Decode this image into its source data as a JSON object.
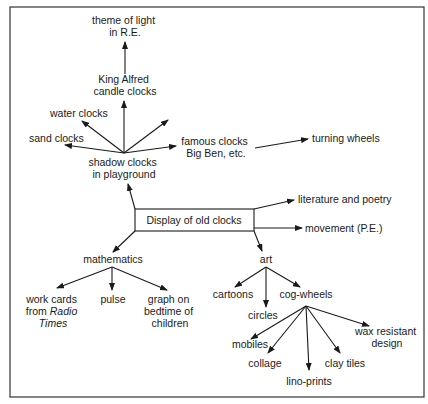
{
  "diagram": {
    "type": "mind-map",
    "center": "Display of old clocks",
    "nodes": {
      "theme_light": [
        "theme of light",
        "in R.E."
      ],
      "king_alfred": [
        "King Alfred",
        "candle clocks"
      ],
      "water_clocks": [
        "water clocks"
      ],
      "sand_clocks": [
        "sand clocks"
      ],
      "shadow_clocks": [
        "shadow clocks",
        "in playground"
      ],
      "famous_clocks": [
        "famous clocks",
        "Big Ben, etc."
      ],
      "turning_wheels": [
        "turning wheels"
      ],
      "literature": [
        "literature and poetry"
      ],
      "movement": [
        "movement (P.E.)"
      ],
      "mathematics": [
        "mathematics"
      ],
      "work_cards": [
        "work cards",
        "from ",
        "Radio",
        "Times"
      ],
      "pulse": [
        "pulse"
      ],
      "graph": [
        "graph on",
        "bedtime of",
        "children"
      ],
      "art": [
        "art"
      ],
      "cartoons": [
        "cartoons"
      ],
      "circles": [
        "circles"
      ],
      "cog_wheels": [
        "cog-wheels"
      ],
      "mobiles": [
        "mobiles"
      ],
      "collage": [
        "collage"
      ],
      "lino_prints": [
        "lino-prints"
      ],
      "clay_tiles": [
        "clay tiles"
      ],
      "wax": [
        "wax resistant",
        "design"
      ]
    }
  }
}
